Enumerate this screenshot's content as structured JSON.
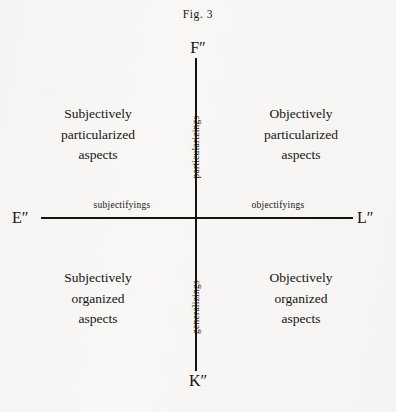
{
  "figure": {
    "caption": "Fig. 3",
    "background_color": "#f8f7f5",
    "ink_color": "#17140f"
  },
  "axes": {
    "vertical": {
      "top_endpoint": "F″",
      "bottom_endpoint": "K″",
      "upper_direction_label": "particularizings",
      "lower_direction_label": "generalizings"
    },
    "horizontal": {
      "left_endpoint": "E″",
      "right_endpoint": "L″",
      "left_direction_label": "subjectifyings",
      "right_direction_label": "objectifyings"
    }
  },
  "quadrants": {
    "top_left": "Subjectively\nparticularized\naspects",
    "top_right": "Objectively\nparticularized\naspects",
    "bottom_left": "Subjectively\norganized\naspects",
    "bottom_right": "Objectively\norganized\naspects"
  }
}
